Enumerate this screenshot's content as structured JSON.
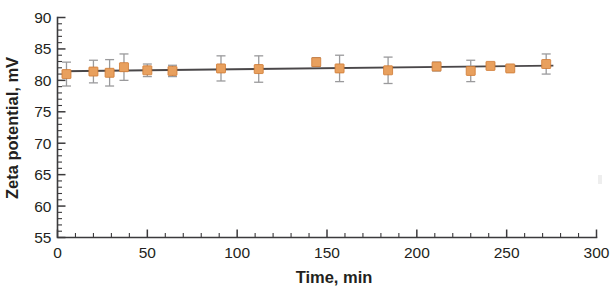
{
  "chart_data": {
    "type": "scatter",
    "title": "",
    "subtitle": "",
    "xlabel": "Time, min",
    "ylabel": "Zeta potential, mV",
    "xlim": [
      0,
      300
    ],
    "ylim": [
      55,
      90
    ],
    "x_ticks": [
      0,
      50,
      100,
      150,
      200,
      250,
      300
    ],
    "y_ticks": [
      55,
      60,
      65,
      70,
      75,
      80,
      85,
      90
    ],
    "x_tick_labels": [
      "0",
      "50",
      "100",
      "150",
      "200",
      "250",
      "300"
    ],
    "y_tick_labels": [
      "55",
      "60",
      "65",
      "70",
      "75",
      "80",
      "85",
      "90"
    ],
    "x_minor_interval": 10,
    "y_minor_interval": 1,
    "grid": false,
    "legend": null,
    "legend_position": "none",
    "marker_shape": "square",
    "marker_color": "#e8a05e",
    "errorbar_color": "#9a9a9c",
    "trendline_color": "#4a4749",
    "series": [
      {
        "name": "Zeta potential",
        "x": [
          5,
          20,
          29,
          37,
          50,
          64,
          91,
          112,
          144,
          157,
          184,
          211,
          230,
          241,
          252,
          272
        ],
        "y": [
          81.0,
          81.4,
          81.2,
          82.1,
          81.6,
          81.5,
          81.9,
          81.8,
          82.9,
          81.9,
          81.6,
          82.2,
          81.5,
          82.3,
          81.9,
          82.6
        ],
        "y_err": [
          1.9,
          1.8,
          2.1,
          2.1,
          1.0,
          0.9,
          2.0,
          2.1,
          0.7,
          2.1,
          2.1,
          0.7,
          1.7,
          0.5,
          0.4,
          1.6
        ]
      }
    ],
    "trendline": {
      "name": "linear fit",
      "x_start": 3,
      "x_end": 276,
      "y_start": 81.45,
      "y_end": 82.35
    }
  }
}
